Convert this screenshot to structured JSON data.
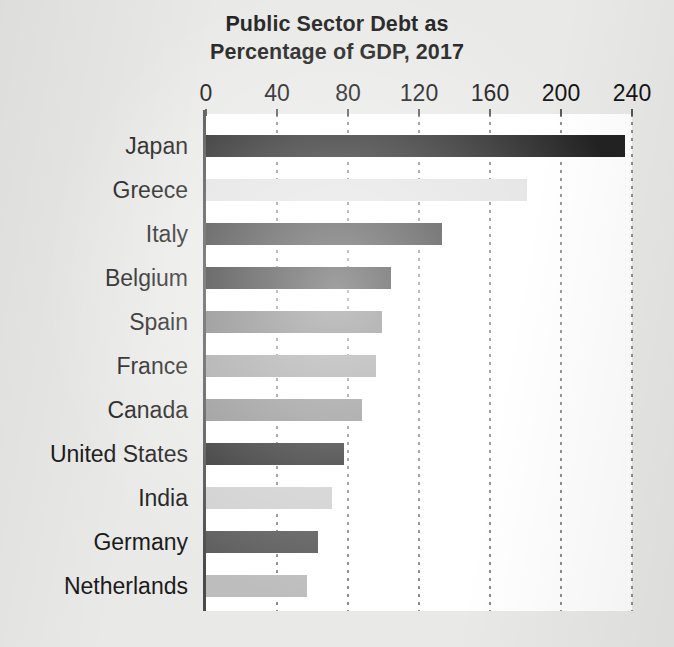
{
  "chart_data": {
    "type": "bar",
    "orientation": "horizontal",
    "title": "Public Sector Debt as Percentage of GDP, 2017",
    "title_lines": [
      "Public Sector Debt as",
      "Percentage of GDP, 2017"
    ],
    "xlabel": "",
    "ylabel": "",
    "xlim": [
      0,
      240
    ],
    "grid": "vertical-dotted",
    "legend": "none",
    "xticks": [
      0,
      40,
      80,
      120,
      160,
      200,
      240
    ],
    "xtick_labels": [
      "0",
      "40",
      "80",
      "120",
      "160",
      "200",
      "240"
    ],
    "categories": [
      "Japan",
      "Greece",
      "Italy",
      "Belgium",
      "Spain",
      "France",
      "Canada",
      "United States",
      "India",
      "Germany",
      "Netherlands"
    ],
    "values": [
      236,
      181,
      133,
      104,
      99,
      96,
      88,
      78,
      71,
      63,
      57
    ],
    "bar_colors": [
      "#222222",
      "#e2e2e2",
      "#3a3a3a",
      "#2e2e2e",
      "#7d7d7d",
      "#a0a0a0",
      "#8e8e8e",
      "#2b2b2b",
      "#cfcfcf",
      "#5a5a5a",
      "#bdbdbd"
    ]
  },
  "figure": {
    "background_color": "#e9e9e7",
    "plot_background_color": "#ffffff",
    "axis_color": "#4a4a4a",
    "text_color": "#1b1b1b"
  }
}
